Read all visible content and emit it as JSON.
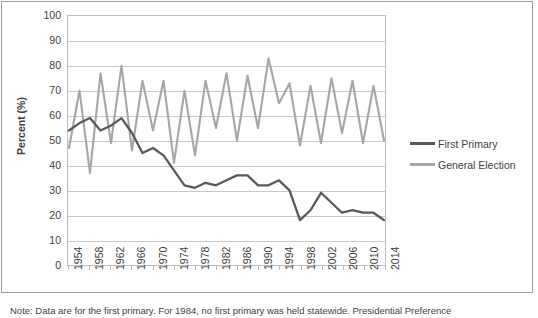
{
  "chart_data": {
    "type": "line",
    "title": "",
    "xlabel": "",
    "ylabel": "Percent (%)",
    "ylim": [
      0,
      100
    ],
    "ytick_step": 10,
    "yticks": [
      100,
      90,
      80,
      70,
      60,
      50,
      40,
      30,
      20,
      10,
      0
    ],
    "grid": true,
    "legend_position": "right",
    "x": [
      1954,
      1956,
      1958,
      1960,
      1962,
      1964,
      1966,
      1968,
      1970,
      1972,
      1974,
      1976,
      1978,
      1980,
      1982,
      1984,
      1986,
      1988,
      1990,
      1992,
      1994,
      1996,
      1998,
      2000,
      2002,
      2004,
      2006,
      2008,
      2010,
      2012,
      2014
    ],
    "xtick_labels": [
      "1954",
      "1958",
      "1962",
      "1966",
      "1970",
      "1974",
      "1978",
      "1982",
      "1986",
      "1990",
      "1994",
      "1998",
      "2002",
      "2006",
      "2010",
      "2014"
    ],
    "series": [
      {
        "name": "First Primary",
        "color": "#595959",
        "values": [
          54,
          57,
          59,
          54,
          56,
          59,
          53,
          45,
          47,
          44,
          38,
          32,
          31,
          33,
          32,
          34,
          36,
          36,
          32,
          32,
          34,
          30,
          18,
          22,
          29,
          25,
          21,
          22,
          21,
          21,
          18
        ]
      },
      {
        "name": "General Election",
        "color": "#a6a6a6",
        "values": [
          47,
          70,
          37,
          77,
          49,
          80,
          46,
          74,
          54,
          74,
          41,
          70,
          44,
          74,
          55,
          77,
          50,
          76,
          55,
          83,
          65,
          73,
          48,
          72,
          49,
          75,
          53,
          74,
          49,
          72,
          50
        ]
      }
    ]
  },
  "legend": {
    "items": [
      {
        "label": "First Primary",
        "color": "#595959"
      },
      {
        "label": "General Election",
        "color": "#a6a6a6"
      }
    ]
  },
  "note": {
    "text": "Note: Data are for the first primary. For 1984, no first primary was held statewide. Presidential Preference"
  }
}
